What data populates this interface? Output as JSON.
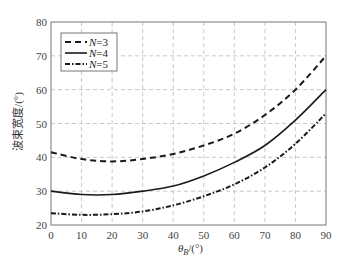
{
  "chart_data": {
    "type": "line",
    "title": "",
    "xlabel": "θ_B/(°)",
    "xlabel_main": "θ",
    "xlabel_sub": "B",
    "xlabel_unit": "/(°)",
    "ylabel": "波束宽度/(°)",
    "xlim": [
      0,
      90
    ],
    "ylim": [
      20,
      80
    ],
    "xticks": [
      0,
      10,
      20,
      30,
      40,
      50,
      60,
      70,
      80,
      90
    ],
    "yticks": [
      20,
      30,
      40,
      50,
      60,
      70,
      80
    ],
    "grid": true,
    "legend_position": "upper left",
    "x": [
      0,
      10,
      20,
      30,
      40,
      50,
      60,
      70,
      80,
      90
    ],
    "series": [
      {
        "name": "N=3",
        "var": "N",
        "eq": "=3",
        "style": "dashed",
        "values": [
          41.5,
          39.5,
          38.8,
          39.5,
          41.0,
          43.5,
          47.0,
          52.5,
          60.0,
          70.0
        ]
      },
      {
        "name": "N=4",
        "var": "N",
        "eq": "=4",
        "style": "solid",
        "values": [
          30.0,
          29.0,
          29.0,
          30.0,
          31.5,
          34.5,
          38.5,
          43.5,
          51.0,
          60.0
        ]
      },
      {
        "name": "N=5",
        "var": "N",
        "eq": "=5",
        "style": "dashdot",
        "values": [
          23.5,
          23.0,
          23.2,
          24.0,
          25.8,
          28.5,
          32.0,
          37.0,
          44.0,
          53.0
        ]
      }
    ]
  }
}
